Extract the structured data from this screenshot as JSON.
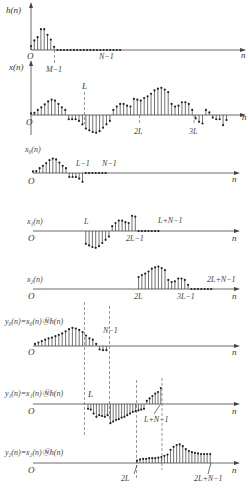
{
  "figure": {
    "panels": [
      {
        "id": "h",
        "ylabel": "h(n)",
        "origin": "O",
        "xlabel": "n",
        "ticks": [
          "M−1",
          "N−1"
        ],
        "values": [
          0.25,
          0.6,
          0.8,
          1.3,
          1.3,
          0.95,
          0.65,
          0.2
        ],
        "zeros_count": 20
      },
      {
        "id": "x",
        "ylabel": "x(n)",
        "origin": "O",
        "xlabel": "n",
        "ticks": [
          "L",
          "2L",
          "3L"
        ],
        "values": [
          0.1,
          0.12,
          0.3,
          0.45,
          0.62,
          0.8,
          0.9,
          0.85,
          0.65,
          0.45,
          0.3,
          -0.25,
          -0.25,
          -0.25,
          -0.35,
          -0.55,
          -0.8,
          -0.9,
          -1.0,
          -1.05,
          -0.95,
          -0.75,
          -0.55,
          -0.35,
          0.3,
          0.5,
          0.65,
          0.65,
          0.55,
          0.5,
          0.95,
          0.9,
          0.85,
          1.0,
          1.1,
          1.25,
          1.45,
          1.55,
          1.6,
          1.5,
          1.35,
          0.65,
          0.5,
          0.55,
          0.75,
          0.75,
          0.65,
          0.3,
          -0.2,
          -0.4,
          -0.5,
          0.3,
          0.15,
          -0.15,
          -0.25,
          -0.25,
          -0.6,
          -0.3
        ],
        "L": 16
      },
      {
        "id": "x0",
        "ylabel": "x₀(n)",
        "origin": "O",
        "xlabel": "n",
        "ticks": [
          "L−1",
          "N−1"
        ]
      },
      {
        "id": "x1",
        "ylabel": "x₁(n)",
        "origin": "O",
        "xlabel": "n",
        "ticks": [
          "L",
          "2L−1",
          "L+N−1"
        ]
      },
      {
        "id": "x2",
        "ylabel": "x₂(n)",
        "origin": "O",
        "xlabel": "n",
        "ticks": [
          "2L",
          "3L−1",
          "2L+N−1"
        ]
      },
      {
        "id": "y0",
        "ylabel": "y₀(n)=x₀(n)Ⓝh(n)",
        "origin": "O",
        "xlabel": "n",
        "ticks": [
          "N−1"
        ],
        "values": [
          0.15,
          0.25,
          0.35,
          0.45,
          0.55,
          0.6,
          0.7,
          0.8,
          0.9,
          1.05,
          1.2,
          1.3,
          1.25,
          1.15,
          1.0,
          0.75,
          0.55,
          0.45,
          0.15,
          -0.25,
          -0.3,
          -0.3
        ]
      },
      {
        "id": "y1",
        "ylabel": "y₁(n)=x₁(n)Ⓝh(n)",
        "origin": "O",
        "xlabel": "n",
        "ticks": [
          "L",
          "L+N−1"
        ],
        "values": [
          -0.3,
          -0.35,
          -0.6,
          -0.8,
          -0.7,
          -0.75,
          -0.8,
          -0.7,
          -1.2,
          -1.1,
          -1.0,
          -0.95,
          -0.85,
          -0.8,
          -0.7,
          -0.6,
          -0.5,
          -0.45,
          -0.4,
          -0.35,
          -0.3,
          0.2,
          0.35,
          0.5,
          0.65,
          0.75,
          1.0
        ]
      },
      {
        "id": "y2",
        "ylabel": "y₂(n)=x₂(n)Ⓝh(n)",
        "origin": "O",
        "xlabel": "n",
        "ticks": [
          "2L",
          "2L+N−1"
        ],
        "values": [
          0.2,
          0.3,
          0.35,
          0.35,
          0.4,
          0.4,
          0.4,
          0.45,
          0.5,
          0.6,
          0.7,
          1.1,
          1.35,
          1.5,
          1.55,
          1.4,
          1.15,
          1.0,
          0.9,
          0.85,
          0.8,
          0.75,
          0.75,
          0.75,
          0.75
        ]
      }
    ]
  }
}
